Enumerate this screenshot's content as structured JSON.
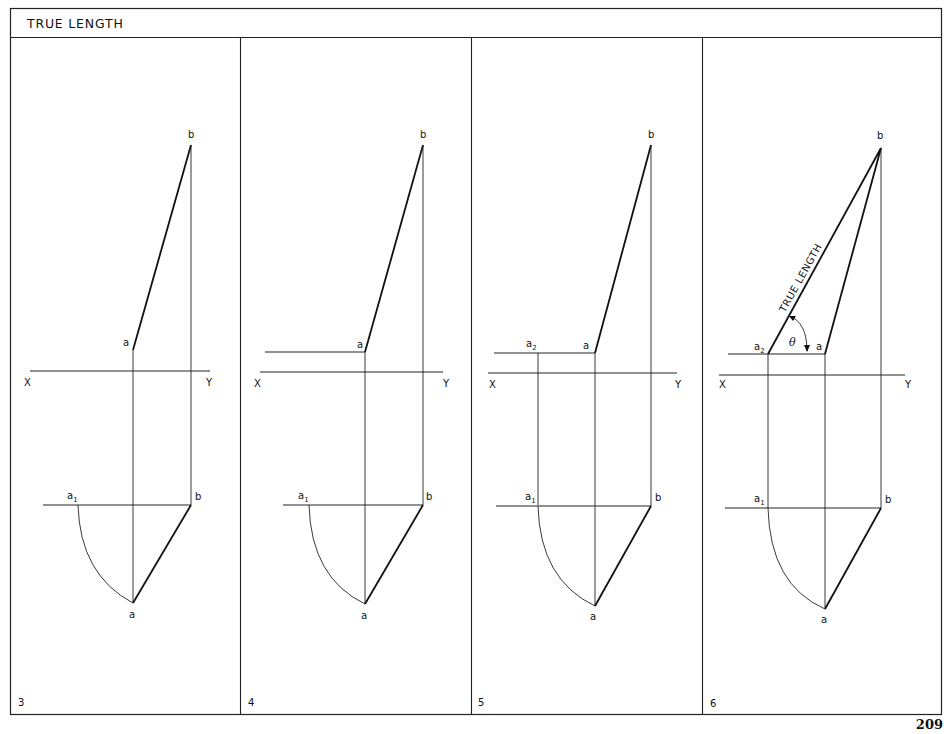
{
  "header": {
    "title": "TRUE LENGTH"
  },
  "page_number": "209",
  "panels": [
    {
      "number": "3",
      "labels": {
        "b_top": "b",
        "a_top": "a",
        "x": "X",
        "y": "Y",
        "a1": "a",
        "a1_sub": "1",
        "b_plan": "b",
        "a_plan": "a"
      }
    },
    {
      "number": "4",
      "labels": {
        "b_top": "b",
        "a_top": "a",
        "x": "X",
        "y": "Y",
        "a1": "a",
        "a1_sub": "1",
        "b_plan": "b",
        "a_plan": "a"
      }
    },
    {
      "number": "5",
      "labels": {
        "b_top": "b",
        "a_top": "a",
        "a2": "a",
        "a2_sub": "2",
        "x": "X",
        "y": "Y",
        "a1": "a",
        "a1_sub": "1",
        "b_plan": "b",
        "a_plan": "a"
      }
    },
    {
      "number": "6",
      "labels": {
        "b_top": "b",
        "a_top": "a",
        "a2": "a",
        "a2_sub": "2",
        "x": "X",
        "y": "Y",
        "a1": "a",
        "a1_sub": "1",
        "b_plan": "b",
        "a_plan": "a",
        "true_length": "TRUE LENGTH",
        "theta": "θ"
      }
    }
  ]
}
